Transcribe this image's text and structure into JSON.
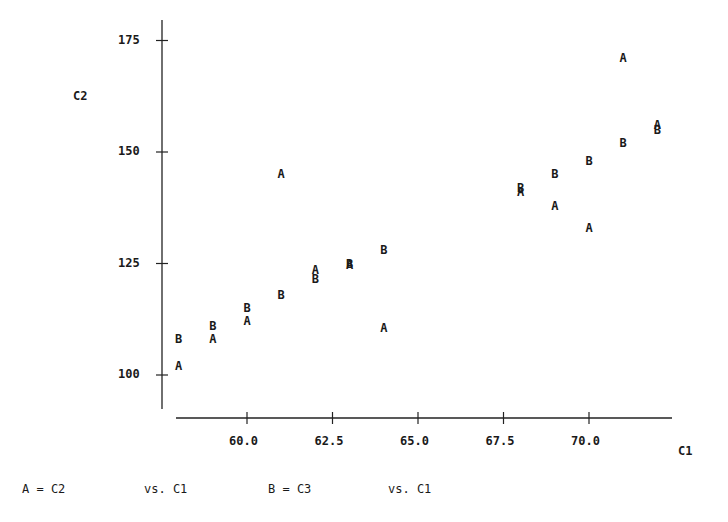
{
  "chart_data": {
    "type": "scatter",
    "title": "",
    "xlabel": "C1",
    "ylabel": "C2",
    "xlim": [
      57.9,
      72.5
    ],
    "ylim": [
      91,
      180
    ],
    "grid": false,
    "x_ticks": [
      "60.0",
      "62.5",
      "65.0",
      "67.5",
      "70.0"
    ],
    "y_ticks": [
      "100",
      "125",
      "150",
      "175"
    ],
    "series": [
      {
        "name": "A = C2 vs. C1",
        "marker": "A",
        "x": [
          58,
          59,
          60,
          61,
          62,
          63,
          64,
          68,
          69,
          70,
          71,
          72
        ],
        "y": [
          102,
          108,
          112,
          145,
          123.5,
          124.7,
          110.5,
          141,
          138,
          133,
          171,
          156
        ]
      },
      {
        "name": "B = C3 vs. C1",
        "marker": "B",
        "x": [
          58,
          59,
          60,
          61,
          62,
          63,
          64,
          68,
          69,
          70,
          71,
          72
        ],
        "y": [
          108,
          111,
          115,
          118,
          121.5,
          125,
          128,
          142,
          145,
          148,
          152,
          155
        ]
      }
    ],
    "legend_position": "bottom"
  },
  "axes": {
    "x_label": "C1",
    "y_label": "C2",
    "x_ticks": [
      {
        "value": 60.0,
        "label": "60.0"
      },
      {
        "value": 62.5,
        "label": "62.5"
      },
      {
        "value": 65.0,
        "label": "65.0"
      },
      {
        "value": 67.5,
        "label": "67.5"
      },
      {
        "value": 70.0,
        "label": "70.0"
      }
    ],
    "y_ticks": [
      {
        "value": 100,
        "label": "100"
      },
      {
        "value": 125,
        "label": "125"
      },
      {
        "value": 150,
        "label": "150"
      },
      {
        "value": 175,
        "label": "175"
      }
    ]
  },
  "legend": {
    "a_def": "A = C2",
    "a_vs": "vs. C1",
    "b_def": "B = C3",
    "b_vs": "vs. C1"
  }
}
